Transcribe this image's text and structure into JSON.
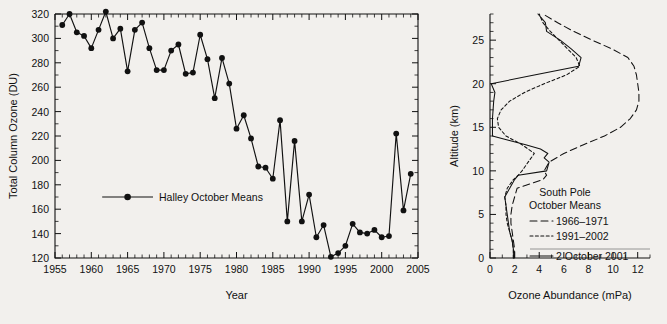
{
  "figure": {
    "background_color": "#f2f0ed",
    "ink_color": "#111111"
  },
  "chart_data": [
    {
      "type": "line",
      "panel": "left",
      "title": "",
      "xlabel": "Year",
      "ylabel": "Total Column Ozone (DU)",
      "xlim": [
        1955,
        2005
      ],
      "ylim": [
        120,
        320
      ],
      "xticks": [
        1955,
        1960,
        1965,
        1970,
        1975,
        1980,
        1985,
        1990,
        1995,
        2000,
        2005
      ],
      "xtick_labels": [
        "1955",
        "1960",
        "1965",
        "1970",
        "1975",
        "1980",
        "1985",
        "1990",
        "1995",
        "2000",
        "2005"
      ],
      "yticks": [
        120,
        140,
        160,
        180,
        200,
        220,
        240,
        260,
        280,
        300,
        320
      ],
      "ytick_labels": [
        "120",
        "140",
        "160",
        "180",
        "200",
        "220",
        "240",
        "260",
        "280",
        "300",
        "320"
      ],
      "minor_x_interval": 1,
      "grid": false,
      "legend_position": "center-left",
      "legend": [
        "Halley October Means"
      ],
      "marker": "filled-circle",
      "series": [
        {
          "name": "Halley October Means",
          "x": [
            1956,
            1957,
            1958,
            1959,
            1960,
            1961,
            1962,
            1963,
            1964,
            1965,
            1966,
            1967,
            1968,
            1969,
            1970,
            1971,
            1972,
            1973,
            1974,
            1975,
            1976,
            1977,
            1978,
            1979,
            1980,
            1981,
            1982,
            1983,
            1984,
            1985,
            1986,
            1987,
            1988,
            1989,
            1990,
            1991,
            1992,
            1993,
            1994,
            1995,
            1996,
            1997,
            1998,
            1999,
            2000,
            2001,
            2002,
            2003,
            2004
          ],
          "values": [
            311,
            320,
            305,
            302,
            292,
            307,
            322,
            300,
            308,
            273,
            307,
            313,
            292,
            274,
            274,
            290,
            295,
            271,
            272,
            303,
            283,
            251,
            284,
            263,
            226,
            237,
            218,
            195,
            194,
            185,
            233,
            150,
            216,
            150,
            172,
            137,
            147,
            121,
            124,
            130,
            148,
            141,
            140,
            143,
            137,
            138,
            222,
            159,
            189
          ]
        }
      ]
    },
    {
      "type": "line",
      "panel": "right",
      "title": "",
      "xlabel": "Ozone Abundance (mPa)",
      "ylabel": "Altitude (km)",
      "xlim": [
        0,
        13
      ],
      "ylim": [
        0,
        28
      ],
      "xticks": [
        0,
        2,
        4,
        6,
        8,
        10,
        12
      ],
      "xtick_labels": [
        "0",
        "2",
        "4",
        "6",
        "8",
        "10",
        "12"
      ],
      "yticks": [
        0,
        5,
        10,
        15,
        20,
        25
      ],
      "ytick_labels": [
        "0",
        "5",
        "10",
        "15",
        "20",
        "25"
      ],
      "minor_x_interval": 1,
      "minor_y_interval": 1,
      "grid": false,
      "orientation": "vertical-profile",
      "legend_position": "center-right",
      "legend_heading": [
        "South Pole",
        "October Means"
      ],
      "legend": [
        "1966–1971",
        "1991–2002",
        "2 October 2001"
      ],
      "series": [
        {
          "name": "1966–1971",
          "style": "long-dash",
          "altitude_km": [
            0,
            1,
            2,
            3,
            4,
            5,
            6,
            7,
            8,
            9,
            9.5,
            10,
            11,
            12,
            13,
            14,
            15,
            16,
            17,
            18,
            19,
            20,
            21,
            22,
            23,
            24,
            25,
            26,
            27,
            28
          ],
          "values_mpa": [
            2.0,
            2.0,
            1.9,
            1.8,
            1.7,
            1.7,
            1.8,
            2.0,
            2.2,
            4.3,
            4.6,
            4.4,
            4.8,
            6.0,
            7.6,
            9.3,
            10.6,
            11.4,
            11.9,
            12.1,
            12.1,
            12.0,
            11.9,
            11.7,
            11.2,
            9.9,
            8.3,
            6.8,
            5.5,
            4.3
          ]
        },
        {
          "name": "1991–2002",
          "style": "short-dash",
          "altitude_km": [
            0,
            1,
            2,
            3,
            4,
            5,
            6,
            7,
            8,
            9,
            9.5,
            10,
            11,
            12,
            13,
            14,
            15,
            16,
            17,
            18,
            19,
            20,
            21,
            22,
            23,
            24,
            25,
            26,
            27,
            28
          ],
          "values_mpa": [
            1.9,
            1.9,
            1.8,
            1.6,
            1.4,
            1.3,
            1.3,
            1.2,
            1.4,
            1.9,
            2.3,
            2.6,
            3.1,
            3.6,
            2.6,
            1.3,
            0.7,
            0.6,
            0.9,
            1.6,
            2.8,
            4.4,
            6.2,
            7.3,
            7.0,
            6.3,
            5.6,
            4.9,
            4.3,
            4.0
          ]
        },
        {
          "name": "2 October 2001",
          "style": "solid",
          "altitude_km": [
            0,
            1,
            2,
            3,
            4,
            5,
            6,
            7,
            8,
            9,
            9.5,
            10,
            10.5,
            11,
            11.5,
            12,
            12.5,
            13,
            13.5,
            14,
            15,
            16,
            17,
            18,
            19,
            20,
            21,
            22,
            23,
            24,
            25,
            26,
            27,
            28
          ],
          "values_mpa": [
            1.9,
            1.9,
            1.8,
            1.6,
            1.5,
            1.4,
            1.3,
            1.2,
            1.6,
            2.0,
            2.3,
            4.6,
            4.7,
            4.8,
            4.4,
            4.7,
            4.1,
            2.9,
            1.5,
            0.2,
            0.2,
            0.2,
            0.25,
            0.3,
            0.4,
            0.1,
            3.6,
            7.2,
            7.4,
            6.6,
            5.7,
            4.6,
            4.5,
            3.9
          ]
        }
      ]
    }
  ]
}
